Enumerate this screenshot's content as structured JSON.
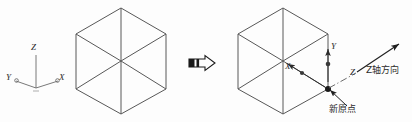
{
  "figure": {
    "title": "",
    "background_color": "#fdfdfd",
    "line_color": "#555555",
    "text_color": "#2b2b2b"
  },
  "left_panel": {
    "name": "original-coordinate-system",
    "cube": {
      "shape": "hexagon-cube-isometric",
      "center_x": 121,
      "center_y": 61
    },
    "axes": {
      "origin_x": 36,
      "origin_y": 88,
      "z_label": "Z",
      "x_label": "X",
      "y_label": "Y"
    }
  },
  "arrow": {
    "name": "transform-arrow",
    "direction": "right",
    "label": ""
  },
  "right_panel": {
    "name": "new-coordinate-system",
    "cube": {
      "shape": "hexagon-cube-isometric",
      "center_x": 283,
      "center_y": 61
    },
    "labels": {
      "y_label": "Y",
      "x_label": "X",
      "z_label": "Z",
      "z_direction_text": "Z轴方向",
      "new_origin_text": "新原点"
    }
  }
}
